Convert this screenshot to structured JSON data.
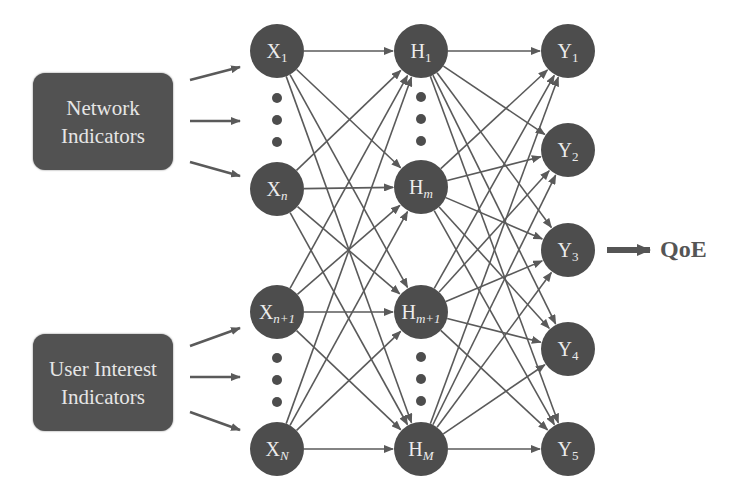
{
  "diagram": {
    "colors": {
      "node_fill": "#4d4d4d",
      "node_text": "#ececec",
      "edge": "#5a5a5a",
      "box_fill": "#525252",
      "box_text": "#e6e6e6",
      "qoe_text": "#555555"
    },
    "node_radius": 27,
    "input_groups": [
      {
        "id": "network",
        "label_line1": "Network",
        "label_line2": "Indicators",
        "x": 33,
        "y": 73,
        "w": 140,
        "h": 97,
        "arrows": [
          [
            190,
            80,
            240,
            67
          ],
          [
            190,
            121,
            240,
            121
          ],
          [
            190,
            162,
            240,
            176
          ]
        ]
      },
      {
        "id": "user-interest",
        "label_line1": "User Interest",
        "label_line2": "Indicators",
        "x": 33,
        "y": 334,
        "w": 140,
        "h": 97,
        "arrows": [
          [
            190,
            346,
            240,
            328
          ],
          [
            190,
            377,
            240,
            377
          ],
          [
            190,
            412,
            240,
            430
          ]
        ]
      }
    ],
    "layers": [
      {
        "name": "input",
        "nodes": [
          {
            "id": "X1",
            "base": "X",
            "sub": "1",
            "sub_italic": false,
            "x": 277,
            "y": 51
          },
          {
            "id": "Xn",
            "base": "X",
            "sub": "n",
            "sub_italic": true,
            "x": 277,
            "y": 189
          },
          {
            "id": "Xn+1",
            "base": "X",
            "sub": "n+1",
            "sub_italic": true,
            "x": 277,
            "y": 312
          },
          {
            "id": "XN",
            "base": "X",
            "sub": "N",
            "sub_italic": true,
            "x": 277,
            "y": 449
          }
        ],
        "ellipses": [
          [
            277,
            98
          ],
          [
            277,
            120
          ],
          [
            277,
            142
          ],
          [
            277,
            358
          ],
          [
            277,
            380
          ],
          [
            277,
            402
          ]
        ]
      },
      {
        "name": "hidden",
        "nodes": [
          {
            "id": "H1",
            "base": "H",
            "sub": "1",
            "sub_italic": false,
            "x": 421,
            "y": 51
          },
          {
            "id": "Hm",
            "base": "H",
            "sub": "m",
            "sub_italic": true,
            "x": 421,
            "y": 187
          },
          {
            "id": "Hm+1",
            "base": "H",
            "sub": "m+1",
            "sub_italic": true,
            "x": 421,
            "y": 312
          },
          {
            "id": "HM",
            "base": "H",
            "sub": "M",
            "sub_italic": true,
            "x": 421,
            "y": 449
          }
        ],
        "ellipses": [
          [
            421,
            97
          ],
          [
            421,
            119
          ],
          [
            421,
            141
          ],
          [
            421,
            357
          ],
          [
            421,
            379
          ],
          [
            421,
            401
          ]
        ]
      },
      {
        "name": "output",
        "nodes": [
          {
            "id": "Y1",
            "base": "Y",
            "sub": "1",
            "sub_italic": false,
            "x": 568,
            "y": 51
          },
          {
            "id": "Y2",
            "base": "Y",
            "sub": "2",
            "sub_italic": false,
            "x": 568,
            "y": 150
          },
          {
            "id": "Y3",
            "base": "Y",
            "sub": "3",
            "sub_italic": false,
            "x": 568,
            "y": 250
          },
          {
            "id": "Y4",
            "base": "Y",
            "sub": "4",
            "sub_italic": false,
            "x": 568,
            "y": 349
          },
          {
            "id": "Y5",
            "base": "Y",
            "sub": "5",
            "sub_italic": false,
            "x": 568,
            "y": 449
          }
        ],
        "ellipses": []
      }
    ],
    "connectivity": "fully-connected",
    "output": {
      "label": "QoE",
      "arrow": [
        607,
        250,
        650,
        250
      ],
      "label_x": 660,
      "label_y": 236
    }
  }
}
